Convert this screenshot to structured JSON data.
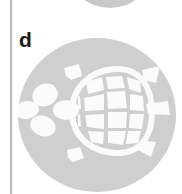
{
  "figure": {
    "panel_label": "d",
    "colors": {
      "background": "#ffffff",
      "disc_fill": "#cfcfcf",
      "neighbor_disc_fill": "#c9c9c9",
      "specimen_fill": "#fbfbfb",
      "divider": "#b8b8b8",
      "label_color": "#1a1a1a"
    },
    "divider": {
      "orientation": "vertical",
      "label": "panel divider rule"
    },
    "neighbor_disc": {
      "label": "adjacent panel disc, clipped at top"
    },
    "specimen_disc": {
      "label": "circular gray disc background"
    },
    "specimen": {
      "subject": "turtle",
      "view": "dorsal",
      "facing": "left",
      "parts": [
        {
          "name": "head",
          "label": "head"
        },
        {
          "name": "front-left-flipper",
          "label": "front left flipper"
        },
        {
          "name": "front-right-flipper",
          "label": "front right flipper"
        },
        {
          "name": "carapace",
          "label": "carapace (shell outline)"
        },
        {
          "name": "vertebral-scutes",
          "label": "vertebral scutes",
          "count": 5
        },
        {
          "name": "costal-scutes",
          "label": "costal scutes",
          "count": 8
        },
        {
          "name": "marginal-scutes",
          "label": "marginal scutes",
          "count": 11
        },
        {
          "name": "rear-left-flipper",
          "label": "rear left flipper"
        },
        {
          "name": "rear-right-flipper",
          "label": "rear right flipper"
        },
        {
          "name": "tail",
          "label": "tail"
        }
      ]
    }
  }
}
